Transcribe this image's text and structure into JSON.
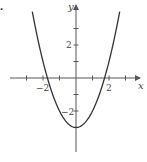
{
  "label_fragment": ".",
  "chart_data": {
    "type": "line",
    "title": "",
    "function": "y = x^2 - 3",
    "xlabel": "x",
    "ylabel": "y",
    "xlim": [
      -4,
      4
    ],
    "ylim": [
      -4.5,
      4.5
    ],
    "x_tick_labels": [
      "-2",
      "2"
    ],
    "y_tick_labels": [
      "2",
      "-2"
    ],
    "x_ticks": [
      -3,
      -2,
      -1,
      1,
      2,
      3
    ],
    "y_ticks": [
      -3,
      -2,
      -1,
      1,
      2,
      3
    ],
    "grid": false,
    "legend": null,
    "series": [
      {
        "name": "parabola",
        "x": [
          -2.65,
          -2,
          -1.73,
          -1,
          0,
          1,
          1.73,
          2,
          2.65
        ],
        "values": [
          4.0,
          1,
          0,
          -2,
          -3,
          -2,
          0,
          1,
          4.0
        ]
      }
    ],
    "annotations": {
      "vertex": [
        0,
        -3
      ],
      "x_intercepts": [
        -1.73,
        1.73
      ]
    },
    "colors": {
      "axis": "#555555",
      "curve": "#333333",
      "text": "#444444"
    }
  }
}
